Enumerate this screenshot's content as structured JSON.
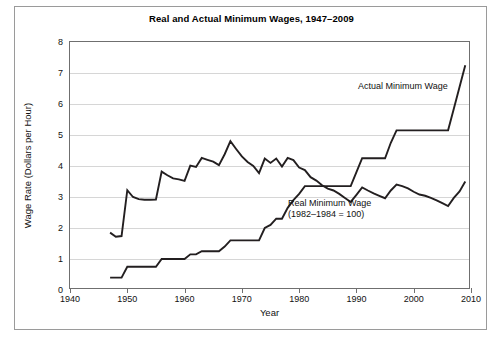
{
  "figure": {
    "title": "Real and Actual Minimum Wages, 1947–2009",
    "border_color": "#9a9a9a"
  },
  "axes": {
    "y_title": "Wage Rate (Dollars per Hour)",
    "x_title": "Year",
    "y_ticks": [
      0,
      1,
      2,
      3,
      4,
      5,
      6,
      7,
      8
    ],
    "y_tick_labels": [
      "0",
      "1",
      "2",
      "3",
      "4",
      "5",
      "6",
      "7",
      "8"
    ],
    "x_ticks": [
      1940,
      1950,
      1960,
      1970,
      1980,
      1990,
      2000,
      2010
    ],
    "x_tick_labels": [
      "1940",
      "1950",
      "1960",
      "1970",
      "1980",
      "1990",
      "2000",
      "2010"
    ]
  },
  "annotations": {
    "actual_label": "Actual Minimum Wage",
    "real_label_line1": "Real Minimum Wage",
    "real_label_line2": "(1982–1984 = 100)"
  },
  "chart_data": {
    "type": "line",
    "title": "Real and Actual Minimum Wages, 1947–2009",
    "xlabel": "Year",
    "ylabel": "Wage Rate (Dollars per Hour)",
    "xlim": [
      1940,
      2010
    ],
    "ylim": [
      0,
      8
    ],
    "grid": "horizontal",
    "legend": "inline-annotations",
    "line_color": "#231f20",
    "series": [
      {
        "name": "Actual Minimum Wage",
        "note": "Nominal federal minimum wage, dollars per hour",
        "x": [
          1947,
          1948,
          1949,
          1950,
          1951,
          1952,
          1953,
          1954,
          1955,
          1956,
          1957,
          1958,
          1959,
          1960,
          1961,
          1962,
          1963,
          1964,
          1965,
          1966,
          1967,
          1968,
          1969,
          1970,
          1971,
          1972,
          1973,
          1974,
          1975,
          1976,
          1977,
          1978,
          1979,
          1980,
          1981,
          1982,
          1983,
          1984,
          1985,
          1986,
          1987,
          1988,
          1989,
          1990,
          1991,
          1992,
          1993,
          1994,
          1995,
          1996,
          1997,
          1998,
          1999,
          2000,
          2001,
          2002,
          2003,
          2004,
          2005,
          2006,
          2007,
          2008,
          2009
        ],
        "y": [
          0.4,
          0.4,
          0.4,
          0.75,
          0.75,
          0.75,
          0.75,
          0.75,
          0.75,
          1.0,
          1.0,
          1.0,
          1.0,
          1.0,
          1.15,
          1.15,
          1.25,
          1.25,
          1.25,
          1.25,
          1.4,
          1.6,
          1.6,
          1.6,
          1.6,
          1.6,
          1.6,
          2.0,
          2.1,
          2.3,
          2.3,
          2.65,
          2.9,
          3.1,
          3.35,
          3.35,
          3.35,
          3.35,
          3.35,
          3.35,
          3.35,
          3.35,
          3.35,
          3.8,
          4.25,
          4.25,
          4.25,
          4.25,
          4.25,
          4.75,
          5.15,
          5.15,
          5.15,
          5.15,
          5.15,
          5.15,
          5.15,
          5.15,
          5.15,
          5.15,
          5.85,
          6.55,
          7.25
        ]
      },
      {
        "name": "Real Minimum Wage (1982–1984 = 100)",
        "note": "Minimum wage in constant 1982–1984 dollars",
        "x": [
          1947,
          1948,
          1949,
          1950,
          1951,
          1952,
          1953,
          1954,
          1955,
          1956,
          1957,
          1958,
          1959,
          1960,
          1961,
          1962,
          1963,
          1964,
          1965,
          1966,
          1967,
          1968,
          1969,
          1970,
          1971,
          1972,
          1973,
          1974,
          1975,
          1976,
          1977,
          1978,
          1979,
          1980,
          1981,
          1982,
          1983,
          1984,
          1985,
          1986,
          1987,
          1988,
          1989,
          1990,
          1991,
          1992,
          1993,
          1994,
          1995,
          1996,
          1997,
          1998,
          1999,
          2000,
          2001,
          2002,
          2003,
          2004,
          2005,
          2006,
          2007,
          2008,
          2009
        ],
        "y": [
          1.85,
          1.72,
          1.74,
          3.22,
          3.0,
          2.93,
          2.91,
          2.91,
          2.92,
          3.82,
          3.7,
          3.6,
          3.57,
          3.52,
          4.01,
          3.97,
          4.26,
          4.2,
          4.14,
          4.03,
          4.38,
          4.8,
          4.55,
          4.31,
          4.13,
          4.0,
          3.77,
          4.24,
          4.1,
          4.24,
          3.98,
          4.26,
          4.19,
          3.95,
          3.87,
          3.64,
          3.53,
          3.38,
          3.27,
          3.21,
          3.1,
          2.97,
          2.84,
          3.07,
          3.31,
          3.21,
          3.12,
          3.04,
          2.96,
          3.21,
          3.4,
          3.35,
          3.28,
          3.17,
          3.08,
          3.04,
          2.97,
          2.89,
          2.8,
          2.71,
          2.97,
          3.18,
          3.5
        ]
      }
    ]
  }
}
